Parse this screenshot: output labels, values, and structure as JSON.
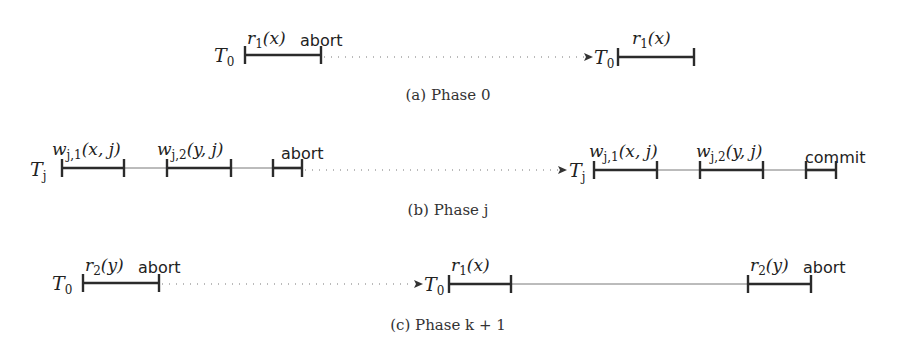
{
  "diagram": {
    "phases": [
      {
        "caption": "(a) Phase 0",
        "rows": [
          {
            "txn": "T",
            "txn_sub": "0",
            "ops": [
              {
                "label": "r₁(x)"
              }
            ],
            "status": "abort"
          },
          {
            "txn": "T",
            "txn_sub": "0",
            "ops": [
              {
                "label": "r₁(x)"
              }
            ],
            "status": ""
          }
        ]
      },
      {
        "caption": "(b) Phase j",
        "rows": [
          {
            "txn": "T",
            "txn_sub": "j",
            "ops": [
              {
                "label": "w_{j,1}(x, j)"
              },
              {
                "label": "w_{j,2}(y, j)"
              }
            ],
            "status": "abort"
          },
          {
            "txn": "T",
            "txn_sub": "j",
            "ops": [
              {
                "label": "w_{j,1}(x, j)"
              },
              {
                "label": "w_{j,2}(y, j)"
              }
            ],
            "status": "commit"
          }
        ]
      },
      {
        "caption": "(c) Phase k + 1",
        "rows": [
          {
            "txn": "T",
            "txn_sub": "0",
            "ops": [
              {
                "label": "r₂(y)"
              }
            ],
            "status": "abort"
          },
          {
            "txn": "T",
            "txn_sub": "0",
            "ops": [
              {
                "label": "r₁(x)"
              },
              {
                "label": "r₂(y)"
              }
            ],
            "status": "abort"
          }
        ]
      }
    ],
    "labels": {
      "r1x": "r",
      "r1x_sub": "1",
      "r1x_arg": "(x)",
      "r2y": "r",
      "r2y_sub": "2",
      "r2y_arg": "(y)",
      "w": "w",
      "wj1_sub": "j,1",
      "wj2_sub": "j,2",
      "wj1_arg": "(x, j)",
      "wj2_arg": "(y, j)",
      "T": "T",
      "sub0": "0",
      "subj": "j",
      "abort": "abort",
      "commit": "commit"
    },
    "captions": {
      "a": "(a) Phase 0",
      "b": "(b) Phase j",
      "c": "(c) Phase k + 1"
    }
  }
}
